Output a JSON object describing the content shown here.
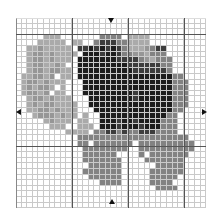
{
  "puzzle": {
    "columns": 34,
    "rows": 34,
    "thick_line_every": 10,
    "thick_columns": [
      10,
      20,
      30
    ],
    "thick_rows": [
      3,
      23
    ],
    "palette": {
      ".": "#ffffff",
      "l": "#aaaaaa",
      "g": "#969696",
      "m": "#828282",
      "d": "#3c3c3c",
      "k": "#1e1e1e"
    },
    "grid": [
      "..................................",
      "..................................",
      "..................................",
      ".....lll.......mmmm.llll..........",
      "....lllll.ll..mdddmmllll..........",
      "..llglllll.ddkdkdkdmlllgmdd.......",
      "..lgglgllll.kkkdkkdmmgglmmm.......",
      "..lgglglll.kkkkkkkddddmglmmm......",
      "..lggllgl..kkkkkkkkkddddddmm......",
      "..lgglggll.kkkkkkkkkkddddddm......",
      ".llgglg.ll.kkkkkkkkkkkkkkkkkmm....",
      ".lgglglll...kkkkkkkkkkkkkkkkmmm...",
      ".lglggl.l...kkkkkkkkkkkkkkkkmmm...",
      ".lgglg.ll...kkkkkkkkkdkkkkkkmmm...",
      "..lgglglll...kkkkkkkkdkkkkkkmmm...",
      "..lglggllll..kkkkkkkkkkkkkkkmmm...",
      "..llgglglll...kkkkkkkkkkkkkkmm....",
      "...lggglgll.l..kkkkkkkkkkkkmm.....",
      ".....lglll.ll..kkkdkkdkkkkmmm.....",
      "......lll..lll.kkkdkkkdkkkmmm.....",
      ".........llll.mmddmdmmdddmmmm.....",
      "...........mmmmmmmmmmmmmmmmmmmm...",
      "...........mm.mmmmmmm.mmmmmmmmmm..",
      "............mmmmmmmm..mmmmmmmmmm..",
      "............mmmmmm....m.mmmmmmm...",
      "............mmmmmmm....mmmmmmm....",
      ".............mmmmmm......mmmmm....",
      "............mmmmmmm.....mmmmmm....",
      ".............mmmmmm.....mmmmm.....",
      "...............mmmm.....mmmm......",
      ".........................mmmm.....",
      "..................................",
      "..................................",
      ".................................."
    ],
    "markers": {
      "top": {
        "label": "top-center-marker",
        "x": 111,
        "y": 20
      },
      "bottom": {
        "label": "bottom-center-marker",
        "x": 112,
        "y": 202
      },
      "left": {
        "label": "left-center-marker",
        "x": 17,
        "y": 112
      },
      "right": {
        "label": "right-center-marker",
        "x": 203,
        "y": 112
      }
    }
  }
}
